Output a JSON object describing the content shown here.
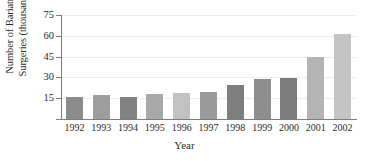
{
  "chart_data": {
    "type": "bar",
    "title": "",
    "xlabel": "Year",
    "ylabel": "Number of Bariatric Surgeries (thousands)",
    "ylabel_line1": "Number of Bariatric",
    "ylabel_line2": "Surgeries (thousands)",
    "categories": [
      "1992",
      "1993",
      "1994",
      "1995",
      "1996",
      "1997",
      "1998",
      "1999",
      "2000",
      "2001",
      "2002"
    ],
    "values": [
      16,
      17,
      16,
      18,
      19,
      19.5,
      24.5,
      28.5,
      29.5,
      44.5,
      61.5
    ],
    "bar_colors": [
      "#8c8c8c",
      "#9d9d9d",
      "#828282",
      "#a8a8a8",
      "#c2c2c2",
      "#9a9a9a",
      "#7e7e7e",
      "#8e8e8e",
      "#7c7c7c",
      "#b4b4b4",
      "#c4c4c4"
    ],
    "ylim": [
      0,
      75
    ],
    "yticks": [
      15,
      30,
      45,
      60,
      75
    ],
    "ytick_labels": [
      "15",
      "30",
      "45",
      "60",
      "75"
    ],
    "grid": true,
    "grid_axis": "y",
    "legend": false,
    "axis_color": "#7d7d7d",
    "gridline_color": "#ececec"
  }
}
